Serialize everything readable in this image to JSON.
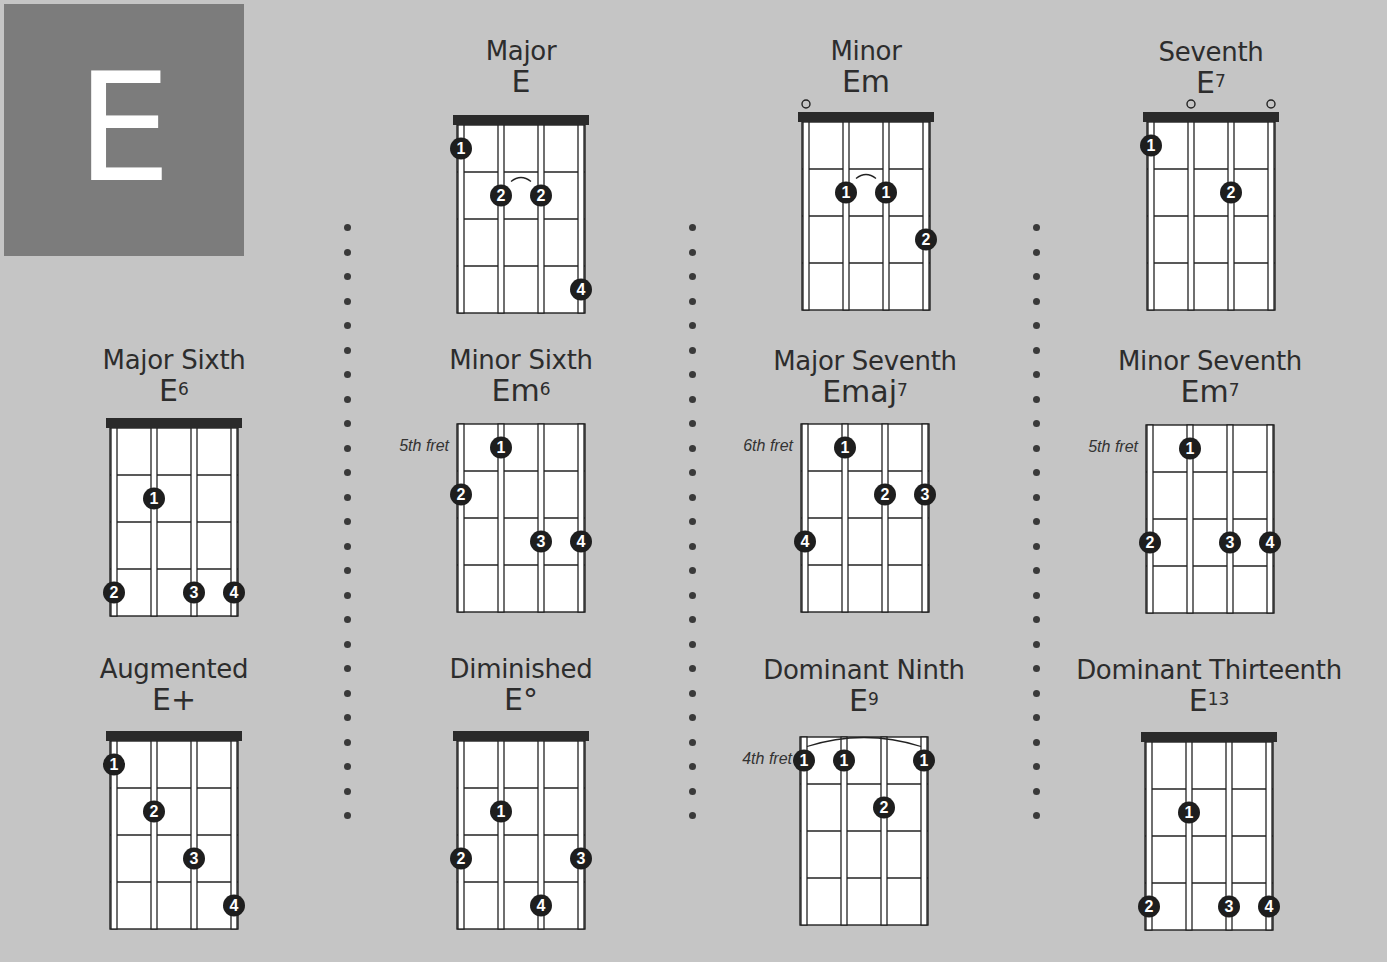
{
  "key": {
    "letter": "E",
    "block_color": "#7c7c7c"
  },
  "colors": {
    "background": "#c5c5c5",
    "ink": "#2d2d2d",
    "fretboard": "#ffffff",
    "dot": "#1e1e1e"
  },
  "chords": [
    {
      "id": "major",
      "name": "Major",
      "symbol": "E",
      "sup": "",
      "nut": true,
      "fret_label": "",
      "open": [],
      "fingers": [
        {
          "string": 0,
          "fret": 1,
          "finger": "1"
        },
        {
          "string": 1,
          "fret": 2,
          "finger": "2"
        },
        {
          "string": 2,
          "fret": 2,
          "finger": "2"
        },
        {
          "string": 3,
          "fret": 4,
          "finger": "4"
        }
      ],
      "tie": {
        "from": 1,
        "to": 2,
        "fret": 2
      }
    },
    {
      "id": "minor",
      "name": "Minor",
      "symbol": "Em",
      "sup": "",
      "nut": true,
      "fret_label": "",
      "open": [
        0
      ],
      "fingers": [
        {
          "string": 1,
          "fret": 2,
          "finger": "1"
        },
        {
          "string": 2,
          "fret": 2,
          "finger": "1"
        },
        {
          "string": 3,
          "fret": 3,
          "finger": "2"
        }
      ],
      "tie": {
        "from": 1,
        "to": 2,
        "fret": 2
      }
    },
    {
      "id": "seventh",
      "name": "Seventh",
      "symbol": "E",
      "sup": "7",
      "nut": true,
      "fret_label": "",
      "open": [
        1,
        3
      ],
      "fingers": [
        {
          "string": 0,
          "fret": 1,
          "finger": "1"
        },
        {
          "string": 2,
          "fret": 2,
          "finger": "2"
        }
      ],
      "tie": null
    },
    {
      "id": "major-sixth",
      "name": "Major Sixth",
      "symbol": "E",
      "sup": "6",
      "nut": true,
      "fret_label": "",
      "open": [],
      "fingers": [
        {
          "string": 1,
          "fret": 2,
          "finger": "1"
        },
        {
          "string": 0,
          "fret": 4,
          "finger": "2"
        },
        {
          "string": 2,
          "fret": 4,
          "finger": "3"
        },
        {
          "string": 3,
          "fret": 4,
          "finger": "4"
        }
      ],
      "tie": null
    },
    {
      "id": "minor-sixth",
      "name": "Minor Sixth",
      "symbol": "Em",
      "sup": "6",
      "nut": false,
      "fret_label": "5th fret",
      "open": [],
      "fingers": [
        {
          "string": 1,
          "fret": 1,
          "finger": "1"
        },
        {
          "string": 0,
          "fret": 2,
          "finger": "2"
        },
        {
          "string": 2,
          "fret": 3,
          "finger": "3"
        },
        {
          "string": 3,
          "fret": 3,
          "finger": "4"
        }
      ],
      "tie": null
    },
    {
      "id": "major-seventh",
      "name": "Major Seventh",
      "symbol": "Emaj",
      "sup": "7",
      "nut": false,
      "fret_label": "6th fret",
      "open": [],
      "fingers": [
        {
          "string": 1,
          "fret": 1,
          "finger": "1"
        },
        {
          "string": 2,
          "fret": 2,
          "finger": "2"
        },
        {
          "string": 3,
          "fret": 2,
          "finger": "3"
        },
        {
          "string": 0,
          "fret": 3,
          "finger": "4"
        }
      ],
      "tie": null
    },
    {
      "id": "minor-seventh",
      "name": "Minor Seventh",
      "symbol": "Em",
      "sup": "7",
      "nut": false,
      "fret_label": "5th fret",
      "open": [],
      "fingers": [
        {
          "string": 1,
          "fret": 1,
          "finger": "1"
        },
        {
          "string": 0,
          "fret": 3,
          "finger": "2"
        },
        {
          "string": 2,
          "fret": 3,
          "finger": "3"
        },
        {
          "string": 3,
          "fret": 3,
          "finger": "4"
        }
      ],
      "tie": null
    },
    {
      "id": "augmented",
      "name": "Augmented",
      "symbol": "E+",
      "sup": "",
      "nut": true,
      "fret_label": "",
      "open": [],
      "fingers": [
        {
          "string": 0,
          "fret": 1,
          "finger": "1"
        },
        {
          "string": 1,
          "fret": 2,
          "finger": "2"
        },
        {
          "string": 2,
          "fret": 3,
          "finger": "3"
        },
        {
          "string": 3,
          "fret": 4,
          "finger": "4"
        }
      ],
      "tie": null
    },
    {
      "id": "diminished",
      "name": "Diminished",
      "symbol": "E°",
      "sup": "",
      "nut": true,
      "fret_label": "",
      "open": [],
      "fingers": [
        {
          "string": 1,
          "fret": 2,
          "finger": "1"
        },
        {
          "string": 0,
          "fret": 3,
          "finger": "2"
        },
        {
          "string": 3,
          "fret": 3,
          "finger": "3"
        },
        {
          "string": 2,
          "fret": 4,
          "finger": "4"
        }
      ],
      "tie": null
    },
    {
      "id": "dominant-ninth",
      "name": "Dominant Ninth",
      "symbol": "E",
      "sup": "9",
      "nut": false,
      "fret_label": "4th fret",
      "open": [],
      "fingers": [
        {
          "string": 0,
          "fret": 1,
          "finger": "1"
        },
        {
          "string": 1,
          "fret": 1,
          "finger": "1"
        },
        {
          "string": 3,
          "fret": 1,
          "finger": "1"
        },
        {
          "string": 2,
          "fret": 2,
          "finger": "2"
        }
      ],
      "tie": {
        "from": 0,
        "to": 3,
        "fret": 1,
        "barre": true
      }
    },
    {
      "id": "dominant-thirteenth",
      "name": "Dominant Thirteenth",
      "symbol": "E",
      "sup": "13",
      "nut": true,
      "fret_label": "",
      "open": [],
      "fingers": [
        {
          "string": 1,
          "fret": 2,
          "finger": "1"
        },
        {
          "string": 0,
          "fret": 4,
          "finger": "2"
        },
        {
          "string": 2,
          "fret": 4,
          "finger": "3"
        },
        {
          "string": 3,
          "fret": 4,
          "finger": "4"
        }
      ],
      "tie": null
    }
  ]
}
